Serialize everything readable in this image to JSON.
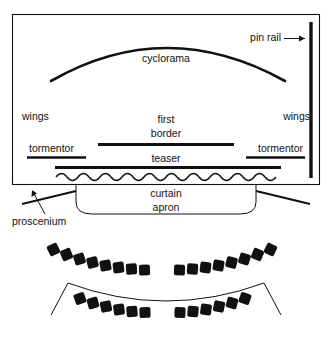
{
  "figure": {
    "ink_color": "#111111",
    "background_color": "#ffffff"
  },
  "stage": {
    "labels": {
      "cyclorama": "cyclorama",
      "pin_rail": "pin rail",
      "wings_left": "wings",
      "wings_right": "wings",
      "first_border": "first",
      "first_border_2": "border",
      "tormentor_left": "tormentor",
      "tormentor_right": "tormentor",
      "teaser": "teaser",
      "curtain": "curtain",
      "apron": "apron",
      "proscenium": "proscenium"
    }
  },
  "house": {
    "rows": [
      {
        "name": "front-arc-row",
        "left_seat_count": 8,
        "right_seat_count": 8
      },
      {
        "name": "rear-arc-row",
        "left_seat_count": 6,
        "right_seat_count": 6
      }
    ]
  }
}
